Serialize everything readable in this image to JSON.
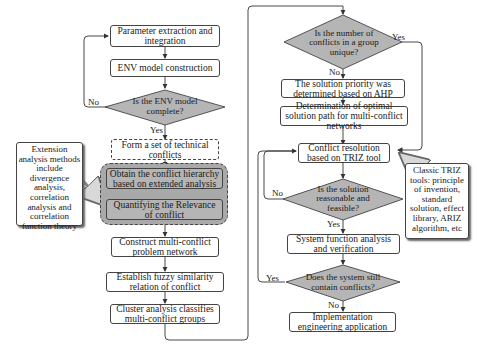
{
  "diagram": {
    "type": "flowchart",
    "left_column": {
      "steps": [
        {
          "id": "param",
          "text": "Parameter extraction and integration"
        },
        {
          "id": "env",
          "text": "ENV model construction"
        },
        {
          "id": "env_check",
          "text": "Is the ENV model complete?",
          "shape": "decision"
        },
        {
          "id": "form_set",
          "text": "Form a set of technical conflicts",
          "style": "dashed"
        },
        {
          "id": "hierarchy",
          "text": "Obtain the conflict hierarchy based on extended analysis",
          "style": "gray"
        },
        {
          "id": "quantify",
          "text": "Quantifying the Relevance of conflict",
          "style": "gray"
        },
        {
          "id": "network",
          "text": "Construct multi-conflict problem network"
        },
        {
          "id": "fuzzy",
          "text": "Establish fuzzy similarity relation of conflict"
        },
        {
          "id": "cluster",
          "text": "Cluster analysis classifies multi-conflict groups"
        }
      ],
      "note": "Extension analysis methods include divergence analysis, correlation analysis and correlation function theory"
    },
    "right_column": {
      "steps": [
        {
          "id": "unique",
          "text": "Is the number of conflicts in a group unique?",
          "shape": "decision"
        },
        {
          "id": "ahp",
          "text": "The solution priority was determined based on AHP"
        },
        {
          "id": "optimal",
          "text": "Determination of optimal solution path for multi-conflict networks"
        },
        {
          "id": "triz",
          "text": "Conflict resolution based on TRIZ tool"
        },
        {
          "id": "feasible",
          "text": "Is the solution reasonable and feasible?",
          "shape": "decision"
        },
        {
          "id": "verify",
          "text": "System function analysis and verification"
        },
        {
          "id": "still",
          "text": "Does the system still contain conflicts?",
          "shape": "decision"
        },
        {
          "id": "implement",
          "text": "Implementation engineering application"
        }
      ],
      "note": "Classic TRIZ tools: principle of invention, standard solution, effect library, ARIZ algorithm, etc"
    },
    "edge_labels": {
      "env_no": "No",
      "env_yes": "Yes",
      "unique_yes": "Yes",
      "unique_no": "No",
      "feasible_no": "No",
      "feasible_yes": "Yes",
      "still_yes": "Yes",
      "still_no": "No"
    },
    "colors": {
      "decision_fill": "#b5b5b5",
      "group_fill": "#a9a9a9",
      "stroke": "#444444"
    }
  }
}
